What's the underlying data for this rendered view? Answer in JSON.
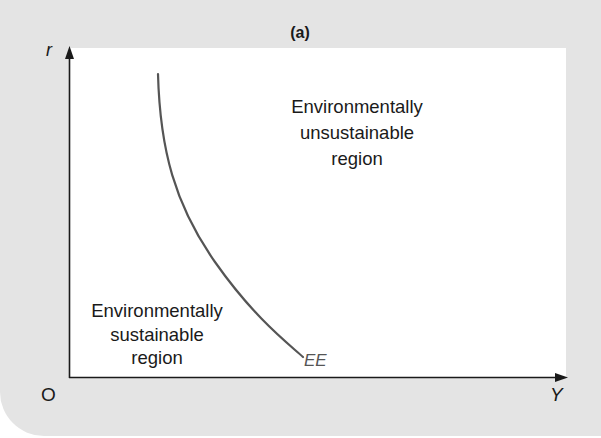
{
  "figure": {
    "panel_label": "(a)",
    "background_color": "#e4e4e4",
    "plot_background_color": "#ffffff"
  },
  "axes": {
    "y_label": "r",
    "x_label": "Y",
    "origin_label": "O",
    "axis_color": "#1a1a1a"
  },
  "curve": {
    "label": "EE",
    "color": "#555555"
  },
  "regions": {
    "unsustainable": {
      "lines": [
        "Environmentally",
        "unsustainable",
        "region"
      ]
    },
    "sustainable": {
      "lines": [
        "Environmentally",
        "sustainable",
        "region"
      ]
    }
  }
}
